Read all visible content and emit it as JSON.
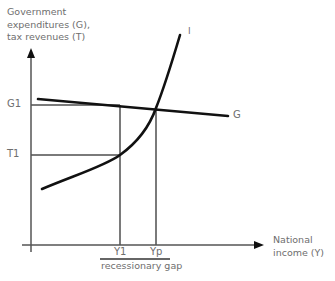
{
  "diagram": {
    "type": "economics-graph",
    "y_axis_label": [
      "Government",
      "expenditures (G),",
      "tax revenues (T)"
    ],
    "x_axis_label": [
      "National",
      "income (Y)"
    ],
    "curves": {
      "tax_curve_label": "I",
      "government_line_label": "G"
    },
    "y_ticks": {
      "g1": "G1",
      "t1": "T1"
    },
    "x_ticks": {
      "y1": "Y1",
      "yp": "Yp"
    },
    "gap_label": "recessionary gap",
    "colors": {
      "curve": "#111111",
      "guide": "#7a7a7a",
      "axis": "#555555",
      "text": "#6e6e6e"
    }
  }
}
